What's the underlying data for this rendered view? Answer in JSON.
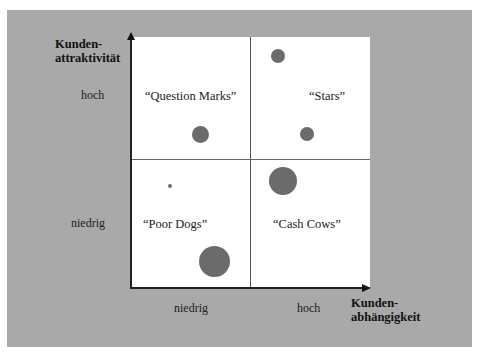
{
  "diagram": {
    "type": "portfolio-matrix",
    "y_axis": {
      "title_line1": "Kunden-",
      "title_line2": "attraktivität",
      "ticks": [
        "hoch",
        "niedrig"
      ]
    },
    "x_axis": {
      "title_line1": "Kunden-",
      "title_line2": "abhängigkeit",
      "ticks": [
        "niedrig",
        "hoch"
      ]
    },
    "quadrants": {
      "top_left": "“Question Marks”",
      "top_right": "“Stars”",
      "bottom_left": "“Poor Dogs”",
      "bottom_right": "“Cash Cows”"
    },
    "bubbles": [
      {
        "quadrant": "Question Marks",
        "cx": 200,
        "cy": 134,
        "d": 17
      },
      {
        "quadrant": "Stars",
        "cx": 278,
        "cy": 56,
        "d": 14
      },
      {
        "quadrant": "Stars",
        "cx": 307,
        "cy": 134,
        "d": 14
      },
      {
        "quadrant": "Cash Cows",
        "cx": 283,
        "cy": 181,
        "d": 28
      },
      {
        "quadrant": "Poor Dogs",
        "cx": 170,
        "cy": 186,
        "d": 4
      },
      {
        "quadrant": "Poor Dogs",
        "cx": 215,
        "cy": 262,
        "d": 31
      }
    ],
    "colors": {
      "panel": "#a9a9a9",
      "plot": "#ffffff",
      "bubble": "#6b6b6b",
      "axis": "#222222"
    }
  }
}
